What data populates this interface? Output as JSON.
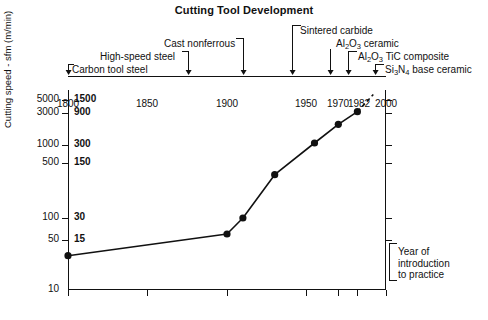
{
  "chart_data": {
    "type": "line",
    "title": "Cutting Tool Development",
    "xlabel": "Year of introduction to practice",
    "ylabel": "Cutting speed - sfm (m/min)",
    "yscale": "log",
    "ylim": [
      10,
      6000
    ],
    "xlim": [
      1800,
      2000
    ],
    "grid": false,
    "legend": "none",
    "x": [
      1800,
      1900,
      1910,
      1930,
      1955,
      1970,
      1982
    ],
    "values_sfm": [
      30,
      60,
      100,
      400,
      1100,
      2000,
      3000
    ],
    "y_unit_primary": "sfm",
    "y_unit_secondary": "m/min",
    "series": [
      {
        "name": "Cutting speed",
        "points": [
          {
            "year": 1800,
            "sfm": 30
          },
          {
            "year": 1900,
            "sfm": 60
          },
          {
            "year": 1910,
            "sfm": 100
          },
          {
            "year": 1930,
            "sfm": 400
          },
          {
            "year": 1955,
            "sfm": 1100
          },
          {
            "year": 1970,
            "sfm": 2000
          },
          {
            "year": 1982,
            "sfm": 3000
          }
        ],
        "extrapolation": {
          "style": "dashed",
          "from_year": 1982,
          "to_year": 1992,
          "to_sfm": 5200
        }
      }
    ],
    "x_ticks": [
      "1800",
      "1850",
      "1900",
      "1950",
      "1970",
      "1982",
      "2000"
    ],
    "x_tick_values": [
      1800,
      1850,
      1900,
      1950,
      1970,
      1982,
      2000
    ],
    "y_ticks_sfm": [
      "5000",
      "3000",
      "1000",
      "500",
      "100",
      "50",
      "10"
    ],
    "y_ticks_mmin": [
      "1500",
      "900",
      "300",
      "150",
      "30",
      "15",
      ""
    ],
    "y_tick_values": [
      5000,
      3000,
      1000,
      500,
      100,
      50,
      10
    ],
    "annotations": [
      {
        "label": "Carbon tool steel",
        "year": 1800
      },
      {
        "label": "High-speed steel",
        "year": 1900
      },
      {
        "label": "Cast nonferrous",
        "year": 1917
      },
      {
        "label": "Sintered carbide",
        "year": 1930
      },
      {
        "label": "Al2O3 ceramic",
        "year": 1955
      },
      {
        "label": "Al2O3 TiC composite",
        "year": 1965
      },
      {
        "label": "Si3N4 base ceramic",
        "year": 1975
      }
    ]
  },
  "chart": {
    "title": "Cutting Tool Development",
    "y_axis_title": "Cutting speed - sfm (m/min)",
    "x_note_lines": [
      "Year of",
      "introduction",
      "to practice"
    ],
    "y_labels": [
      {
        "sfm": "5000",
        "mmin": "1500"
      },
      {
        "sfm": "3000",
        "mmin": "900"
      },
      {
        "sfm": "1000",
        "mmin": "300"
      },
      {
        "sfm": "500",
        "mmin": "150"
      },
      {
        "sfm": "100",
        "mmin": "30"
      },
      {
        "sfm": "50",
        "mmin": "15"
      },
      {
        "sfm": "10",
        "mmin": ""
      }
    ],
    "x_labels": [
      "1800",
      "1850",
      "1900",
      "1950",
      "1970",
      "1982",
      "2000"
    ],
    "callouts": [
      {
        "key": "carbon-tool-steel",
        "text": "Carbon tool steel"
      },
      {
        "key": "high-speed-steel",
        "text": "High-speed steel"
      },
      {
        "key": "cast-nonferrous",
        "text": "Cast nonferrous"
      },
      {
        "key": "sintered-carbide",
        "text": "Sintered carbide"
      },
      {
        "key": "al2o3-ceramic",
        "text": "Al"
      },
      {
        "key": "al2o3-ceramic-tail",
        "text": "O"
      },
      {
        "key": "al2o3-ceramic-end",
        "text": " ceramic"
      },
      {
        "key": "al2o3-tic",
        "text": "Al"
      },
      {
        "key": "al2o3-tic-tail",
        "text": "O"
      },
      {
        "key": "al2o3-tic-end",
        "text": " TiC composite"
      },
      {
        "key": "si3n4",
        "text": "Si"
      },
      {
        "key": "si3n4-tail",
        "text": "N"
      },
      {
        "key": "si3n4-end",
        "text": " base ceramic"
      }
    ],
    "subscripts": {
      "two": "2",
      "three": "3",
      "four": "4"
    },
    "colors": {
      "ink": "#111111",
      "background": "#ffffff"
    }
  }
}
